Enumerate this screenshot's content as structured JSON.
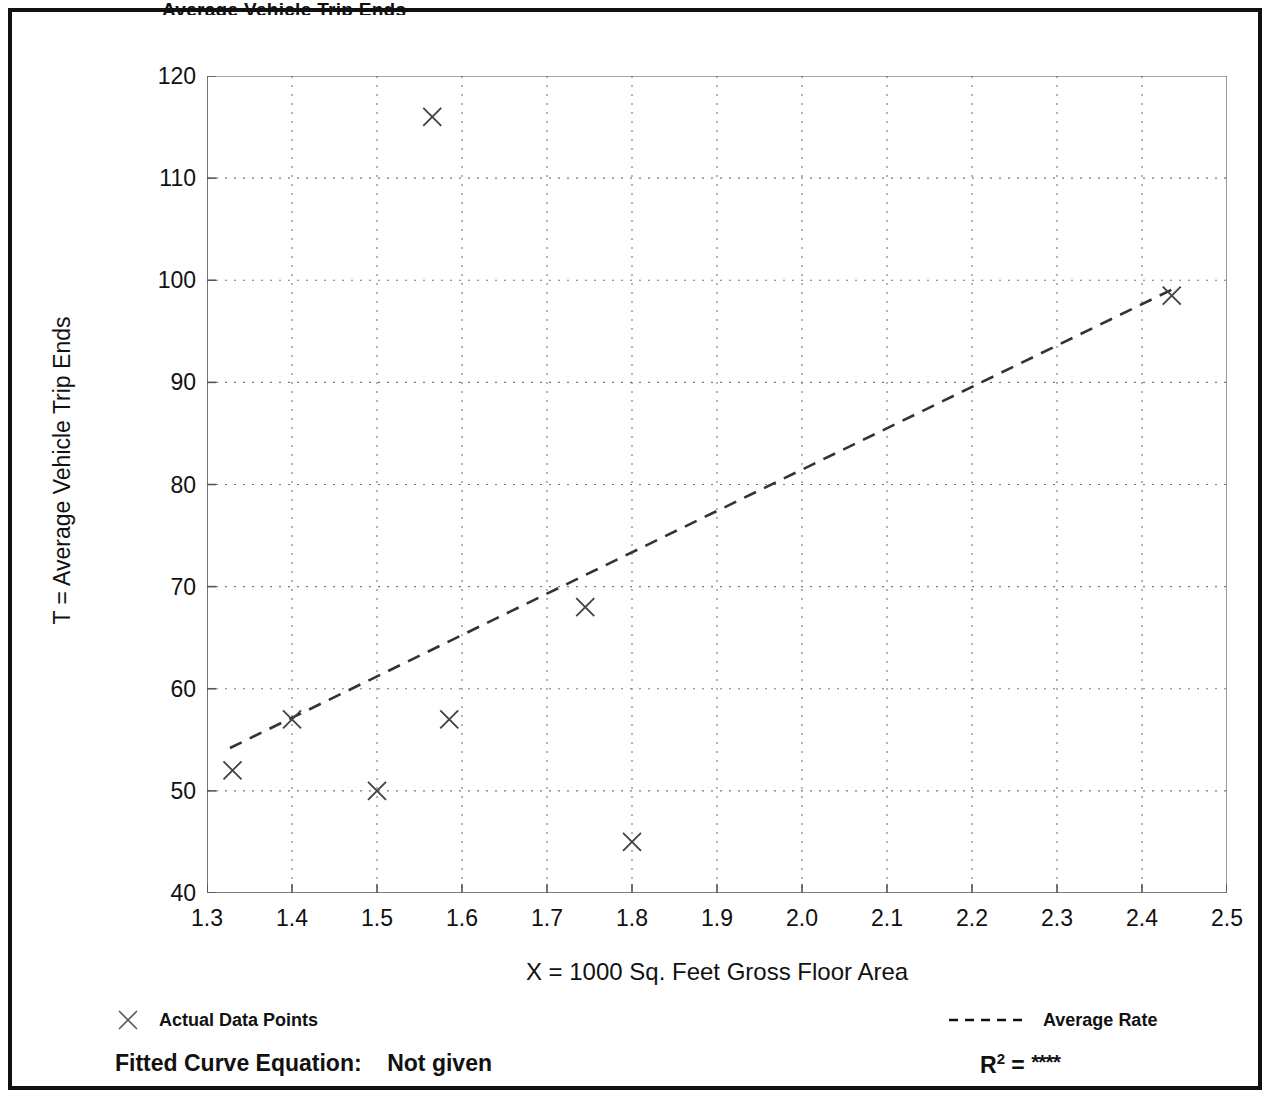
{
  "title": "Average Vehicle Trip Ends",
  "legend": {
    "points_label": "Actual Data Points",
    "points_marker": "x-marker-icon",
    "rate_label": "Average Rate",
    "rate_marker": "dashed-line-icon"
  },
  "footer": {
    "fitted_curve_label": "Fitted Curve Equation:",
    "fitted_curve_value": "Not given",
    "r_squared_label": "R",
    "r_squared_exponent": "2",
    "r_squared_equals": "=",
    "r_squared_value": "****"
  },
  "colors": {
    "frame": "#111111",
    "axis": "#555555",
    "grid": "#777777",
    "marker": "#444444",
    "trend": "#333333",
    "background": "#ffffff"
  },
  "chart_data": {
    "type": "scatter",
    "title": "Average Vehicle Trip Ends",
    "xlabel": "X = 1000 Sq. Feet Gross Floor Area",
    "ylabel": "T = Average Vehicle Trip Ends",
    "xlim": [
      1.3,
      2.5
    ],
    "ylim": [
      40,
      120
    ],
    "xticks": [
      "1.3",
      "1.4",
      "1.5",
      "1.6",
      "1.7",
      "1.8",
      "1.9",
      "2.0",
      "2.1",
      "2.2",
      "2.3",
      "2.4",
      "2.5"
    ],
    "xtick_values": [
      1.3,
      1.4,
      1.5,
      1.6,
      1.7,
      1.8,
      1.9,
      2.0,
      2.1,
      2.2,
      2.3,
      2.4,
      2.5
    ],
    "yticks": [
      "40",
      "50",
      "60",
      "70",
      "80",
      "90",
      "100",
      "110",
      "120"
    ],
    "ytick_values": [
      40,
      50,
      60,
      70,
      80,
      90,
      100,
      110,
      120
    ],
    "y_minor_ticks": [
      45,
      55,
      65,
      75,
      85,
      95,
      105,
      115
    ],
    "grid": true,
    "grid_style": "dotted",
    "legend_position": "below-plot",
    "series": [
      {
        "name": "Actual Data Points",
        "type": "scatter",
        "marker": "x",
        "points": [
          {
            "x": 1.33,
            "y": 52
          },
          {
            "x": 1.4,
            "y": 57
          },
          {
            "x": 1.5,
            "y": 50
          },
          {
            "x": 1.565,
            "y": 116
          },
          {
            "x": 1.585,
            "y": 57
          },
          {
            "x": 1.745,
            "y": 68
          },
          {
            "x": 1.8,
            "y": 45
          },
          {
            "x": 2.435,
            "y": 98.5
          }
        ]
      },
      {
        "name": "Average Rate",
        "type": "line",
        "style": "dashed",
        "points": [
          {
            "x": 1.327,
            "y": 54.2
          },
          {
            "x": 2.438,
            "y": 99.2
          }
        ]
      }
    ]
  }
}
